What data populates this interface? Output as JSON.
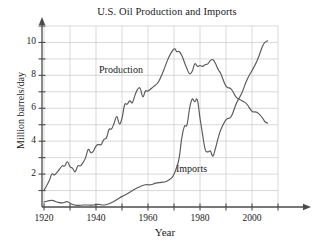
{
  "chart_data": {
    "type": "line",
    "title": "U.S. Oil Production and Imports",
    "xlabel": "Year",
    "ylabel": "Million barrels/day",
    "xlim": [
      1915,
      2012
    ],
    "ylim": [
      0,
      11.4
    ],
    "grid": true,
    "legend_position": "inline-annotations",
    "x_ticks": [
      1920,
      1930,
      1940,
      1950,
      1960,
      1970,
      1980,
      1990,
      2000,
      2010
    ],
    "x_tick_labels": [
      "1920",
      "",
      "1940",
      "",
      "1960",
      "",
      "1980",
      "",
      "2000",
      ""
    ],
    "x_labeled_ticks": [
      {
        "value": 1920,
        "label": "1920"
      },
      {
        "value": 1940,
        "label": "1940"
      },
      {
        "value": 1960,
        "label": "1960"
      },
      {
        "value": 1980,
        "label": "1980"
      },
      {
        "value": 2000,
        "label": "2000"
      }
    ],
    "y_ticks": [
      1,
      2,
      3,
      4,
      5,
      6,
      7,
      8,
      9,
      10,
      11
    ],
    "y_labeled_ticks": [
      {
        "value": 2,
        "label": "2"
      },
      {
        "value": 4,
        "label": "4"
      },
      {
        "value": 6,
        "label": "6"
      },
      {
        "value": 8,
        "label": "8"
      },
      {
        "value": 10,
        "label": "10"
      }
    ],
    "gridlines_x": [
      1920,
      1930,
      1940,
      1950,
      1960,
      1970,
      1980,
      1990,
      2000,
      2010
    ],
    "gridlines_y": [
      1,
      2,
      3,
      4,
      5,
      6,
      7,
      8,
      9,
      10,
      11
    ],
    "series": [
      {
        "name": "Production",
        "label": "Production",
        "color": "#5a5a5a",
        "x": [
          1920,
          1922,
          1923,
          1924,
          1925,
          1926,
          1927,
          1928,
          1929,
          1930,
          1931,
          1932,
          1933,
          1934,
          1935,
          1936,
          1937,
          1938,
          1939,
          1940,
          1941,
          1942,
          1943,
          1944,
          1945,
          1946,
          1947,
          1948,
          1949,
          1950,
          1951,
          1952,
          1953,
          1954,
          1955,
          1956,
          1957,
          1958,
          1959,
          1960,
          1962,
          1964,
          1966,
          1968,
          1970,
          1971,
          1972,
          1973,
          1974,
          1975,
          1976,
          1977,
          1978,
          1979,
          1980,
          1981,
          1982,
          1983,
          1984,
          1985,
          1986,
          1987,
          1988,
          1990,
          1992,
          1994,
          1996,
          1998,
          2000,
          2002,
          2004,
          2005,
          2006
        ],
        "y": [
          1.0,
          1.6,
          2.0,
          1.95,
          2.1,
          2.3,
          2.5,
          2.5,
          2.75,
          2.45,
          2.35,
          2.15,
          2.5,
          2.5,
          2.7,
          3.0,
          3.5,
          3.3,
          3.4,
          3.7,
          3.8,
          3.8,
          4.1,
          4.2,
          4.7,
          4.75,
          5.1,
          5.5,
          5.05,
          5.4,
          6.2,
          6.25,
          6.45,
          6.35,
          6.8,
          7.15,
          7.2,
          6.7,
          7.05,
          7.05,
          7.3,
          7.6,
          8.3,
          9.1,
          9.6,
          9.45,
          9.45,
          9.2,
          8.8,
          8.4,
          8.1,
          8.25,
          8.7,
          8.55,
          8.6,
          8.55,
          8.65,
          8.7,
          8.9,
          8.95,
          8.7,
          8.35,
          8.1,
          7.35,
          7.17,
          6.66,
          6.47,
          6.25,
          5.82,
          5.75,
          5.42,
          5.18,
          5.1
        ],
        "start_value": 1.0,
        "peak": {
          "year": 1970,
          "value": 9.6
        },
        "end_value": 5.1
      },
      {
        "name": "Imports",
        "label": "Imports",
        "color": "#5a5a5a",
        "x": [
          1920,
          1923,
          1925,
          1927,
          1929,
          1931,
          1933,
          1935,
          1937,
          1939,
          1941,
          1943,
          1945,
          1947,
          1949,
          1951,
          1953,
          1955,
          1957,
          1959,
          1961,
          1963,
          1965,
          1967,
          1969,
          1970,
          1971,
          1972,
          1973,
          1974,
          1975,
          1976,
          1977,
          1978,
          1979,
          1980,
          1981,
          1982,
          1983,
          1984,
          1985,
          1986,
          1987,
          1988,
          1990,
          1992,
          1994,
          1996,
          1998,
          2000,
          2002,
          2004,
          2005,
          2006
        ],
        "y": [
          0.3,
          0.4,
          0.3,
          0.25,
          0.32,
          0.15,
          0.1,
          0.12,
          0.12,
          0.12,
          0.16,
          0.12,
          0.2,
          0.35,
          0.55,
          0.72,
          0.9,
          1.1,
          1.25,
          1.35,
          1.35,
          1.45,
          1.5,
          1.55,
          1.75,
          2.0,
          2.4,
          3.0,
          4.2,
          4.9,
          5.0,
          6.0,
          6.55,
          6.4,
          6.5,
          5.4,
          4.4,
          3.5,
          3.35,
          3.4,
          3.1,
          3.6,
          4.2,
          4.7,
          5.3,
          5.5,
          6.3,
          6.9,
          7.7,
          8.3,
          8.9,
          9.75,
          10.0,
          10.1
        ],
        "start_value": 0.3,
        "peak_1977": {
          "year": 1977,
          "value": 6.55
        },
        "trough_1985": {
          "year": 1985,
          "value": 3.1
        },
        "end_value": 10.1
      }
    ],
    "crossover": {
      "year": 1993,
      "value": 7.0,
      "note": "Imports overtake Production"
    }
  },
  "figure": {
    "background_color": "#ffffff",
    "axis_color": "#4b4b4b",
    "grid_color": "#c8c8c8",
    "text_color": "#1a1a1a"
  }
}
